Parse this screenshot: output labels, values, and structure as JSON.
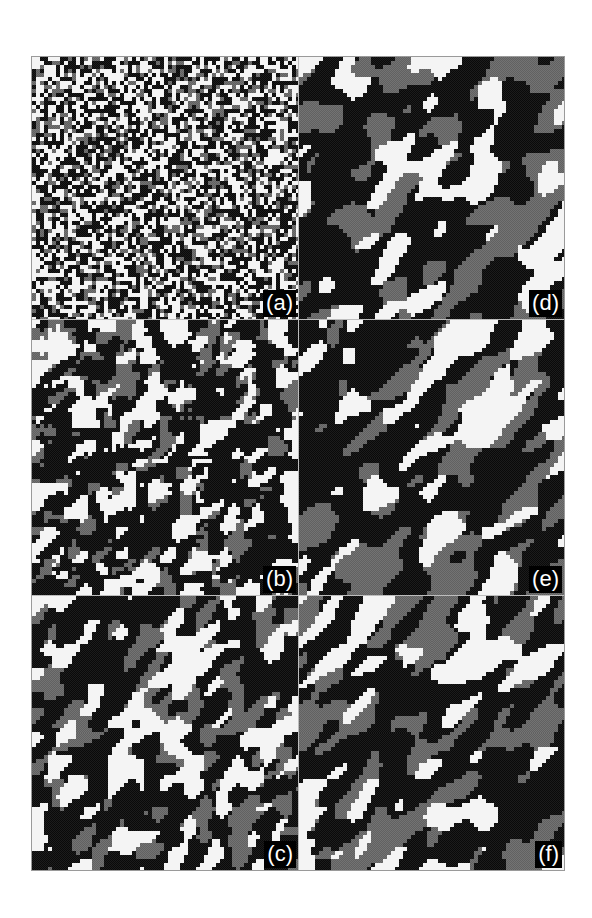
{
  "figure": {
    "colors": {
      "black": "#141414",
      "grey": "#6b6b6b",
      "white": "#f4f4f4",
      "label_bg": "#000000",
      "label_fg": "#ffffff"
    },
    "panels": [
      {
        "id": "a",
        "label": "(a)",
        "column": 1,
        "row": 1,
        "cell": 4,
        "smooth": 0,
        "white": 0.4,
        "grey": 0.18,
        "diag": 0.0
      },
      {
        "id": "b",
        "label": "(b)",
        "column": 1,
        "row": 2,
        "cell": 4,
        "smooth": 1,
        "white": 0.3,
        "grey": 0.16,
        "diag": 0.25
      },
      {
        "id": "c",
        "label": "(c)",
        "column": 1,
        "row": 3,
        "cell": 4,
        "smooth": 2,
        "white": 0.28,
        "grey": 0.2,
        "diag": 0.45
      },
      {
        "id": "d",
        "label": "(d)",
        "column": 2,
        "row": 1,
        "cell": 4,
        "smooth": 4,
        "white": 0.22,
        "grey": 0.26,
        "diag": 0.75
      },
      {
        "id": "e",
        "label": "(e)",
        "column": 2,
        "row": 2,
        "cell": 4,
        "smooth": 4,
        "white": 0.22,
        "grey": 0.26,
        "diag": 0.8
      },
      {
        "id": "f",
        "label": "(f)",
        "column": 2,
        "row": 3,
        "cell": 4,
        "smooth": 4,
        "white": 0.22,
        "grey": 0.26,
        "diag": 0.8
      }
    ]
  }
}
